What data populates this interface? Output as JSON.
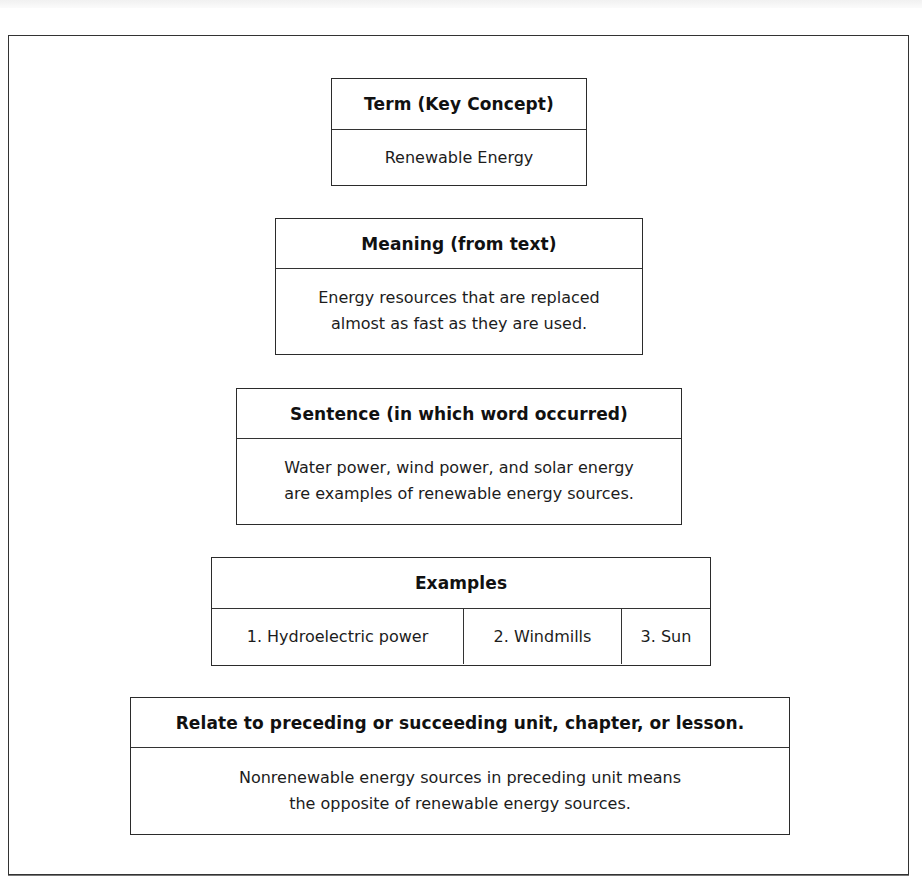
{
  "organizer": {
    "term": {
      "header": "Term (Key Concept)",
      "value": "Renewable Energy"
    },
    "meaning": {
      "header": "Meaning (from text)",
      "lines": [
        "Energy resources that are replaced",
        "almost as fast as they are used."
      ]
    },
    "sentence": {
      "header": "Sentence (in which word occurred)",
      "lines": [
        "Water power, wind power, and solar energy",
        "are examples of renewable energy sources."
      ]
    },
    "examples": {
      "header": "Examples",
      "items": [
        "1. Hydroelectric power",
        "2. Windmills",
        "3. Sun"
      ]
    },
    "relate": {
      "header": "Relate to preceding or succeeding unit, chapter, or lesson.",
      "lines": [
        "Nonrenewable energy sources in preceding unit means",
        "the opposite of renewable energy sources."
      ]
    }
  }
}
